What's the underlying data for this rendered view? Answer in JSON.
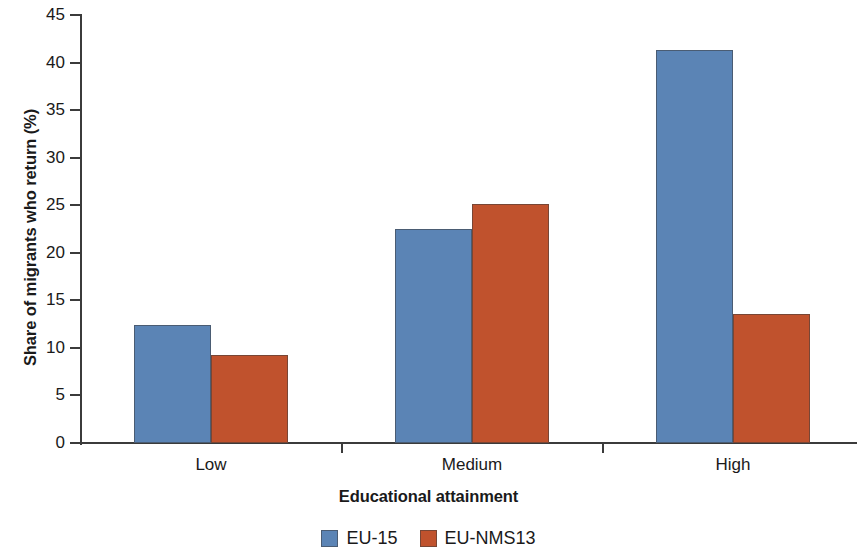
{
  "chart_data": {
    "type": "bar",
    "title": "",
    "subtitle": "",
    "xlabel": "Educational attainment",
    "ylabel": "Share of migrants who return (%)",
    "categories": [
      "Low",
      "Medium",
      "High"
    ],
    "series": [
      {
        "name": "EU-15",
        "color": "#5b84b5",
        "values": [
          12.4,
          22.5,
          41.3
        ]
      },
      {
        "name": "EU-NMS13",
        "color": "#c0522d",
        "values": [
          9.3,
          25.1,
          13.6
        ]
      }
    ],
    "ylim": [
      0,
      45
    ],
    "ytick_values": [
      0,
      5,
      10,
      15,
      20,
      25,
      30,
      35,
      40,
      45
    ],
    "ytick_labels": [
      "0",
      "5",
      "10",
      "15",
      "20",
      "25",
      "30",
      "35",
      "40",
      "45"
    ],
    "grid": false,
    "legend_position": "bottom",
    "annotations": []
  },
  "axes": {
    "y_title": "Share of migrants who return (%)",
    "x_title": "Educational attainment"
  },
  "legend": {
    "items": [
      {
        "label": "EU-15",
        "swatch": "blue-swatch-icon"
      },
      {
        "label": "EU-NMS13",
        "swatch": "orange-swatch-icon"
      }
    ]
  }
}
